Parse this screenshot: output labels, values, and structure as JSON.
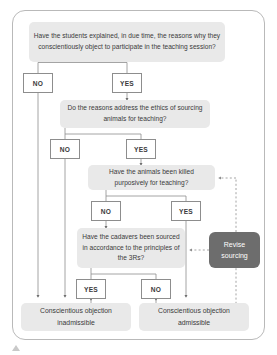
{
  "diagram": {
    "frame": {
      "style": "rounded-rectangle-border"
    },
    "colors": {
      "question_fill": "#e9e9e9",
      "result_fill": "#e9e9e9",
      "revise_fill": "#6d6d6d",
      "revise_text": "#ffffff",
      "choice_fill": "#ffffff",
      "choice_border": "#8d8d8d",
      "line": "#8d8d8d",
      "text": "#3a3a3a",
      "frame_border": "#b9b9b9"
    },
    "questions": [
      {
        "id": "q1",
        "text": "Have the students explained, in due time, the reasons why they conscientiously object to participate in the teaching session?"
      },
      {
        "id": "q2",
        "text": "Do the reasons address the ethics of sourcing animals for teaching?"
      },
      {
        "id": "q3",
        "text": "Have the animals been killed purposively for teaching?"
      },
      {
        "id": "q4",
        "text": "Have the cadavers been sourced in accordance to the principles of the 3Rs?"
      }
    ],
    "choices": [
      {
        "id": "q1-no",
        "label": "NO"
      },
      {
        "id": "q1-yes",
        "label": "YES"
      },
      {
        "id": "q2-no",
        "label": "NO"
      },
      {
        "id": "q2-yes",
        "label": "YES"
      },
      {
        "id": "q3-no",
        "label": "NO"
      },
      {
        "id": "q3-yes",
        "label": "YES"
      },
      {
        "id": "q4-yes",
        "label": "YES"
      },
      {
        "id": "q4-no",
        "label": "NO"
      }
    ],
    "action": {
      "id": "revise",
      "text": "Revise sourcing"
    },
    "results": [
      {
        "id": "inadmissible",
        "text": "Conscientious objection inadmissible"
      },
      {
        "id": "admissible",
        "text": "Conscientious objection admissible"
      }
    ]
  }
}
